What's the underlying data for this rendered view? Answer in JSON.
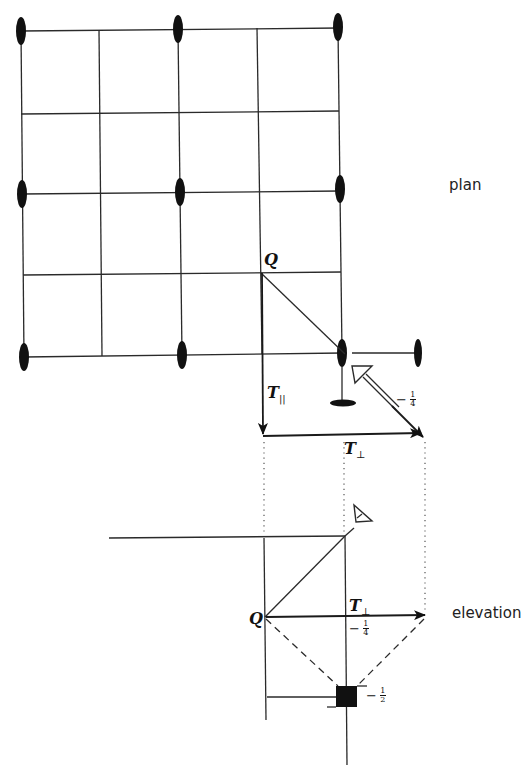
{
  "labels": {
    "plan": "plan",
    "elevation": "elevation",
    "Q_plan": "Q",
    "Q_elev": "Q",
    "T_parallel": "T",
    "T_parallel_sub": "||",
    "T_perp_plan": "T",
    "T_perp_plan_sub": "⊥",
    "T_perp_elev": "T",
    "T_perp_elev_sub": "⊥"
  },
  "heights": {
    "screw_axis_plan": {
      "sign": "−",
      "num": "1",
      "den": "4"
    },
    "elev_T_perp": {
      "sign": "−",
      "num": "1",
      "den": "4"
    },
    "elev_square": {
      "sign": "−",
      "num": "1",
      "den": "2"
    }
  },
  "symbols": {
    "twofold_axis": "black-ellipse",
    "threefold_screw": "open-triangle",
    "fourfold_inversion": "black-square"
  },
  "colors": {
    "ink": "#1a1a1a",
    "background": "#ffffff"
  }
}
